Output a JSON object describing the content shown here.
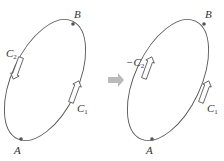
{
  "left_panel": {
    "point_a": "A",
    "point_b": "B",
    "curve_1": {
      "name": "C",
      "sub": "1",
      "prefix": ""
    },
    "curve_2": {
      "name": "C",
      "sub": "2",
      "prefix": ""
    }
  },
  "right_panel": {
    "point_a": "A",
    "point_b": "B",
    "curve_1": {
      "name": "C",
      "sub": "1",
      "prefix": ""
    },
    "curve_2": {
      "name": "C",
      "sub": "2",
      "prefix": "−"
    }
  },
  "colors": {
    "curve": "#555555",
    "point": "#555555",
    "transform_arrow": "#bbbbbb"
  }
}
